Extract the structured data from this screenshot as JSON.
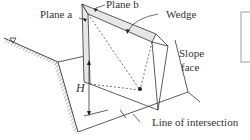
{
  "diagram": {
    "type": "wedge-failure-schematic",
    "labels": {
      "plane_a": "Plane a",
      "plane_b": "Plane b",
      "wedge": "Wedge",
      "slope_face_line1": "Slope",
      "slope_face_line2": "face",
      "height": "H",
      "line_of_intersection": "Line of intersection"
    },
    "colors": {
      "line": "#333333",
      "plane_fill": "#e6e6e6",
      "background": "#ffffff"
    }
  }
}
